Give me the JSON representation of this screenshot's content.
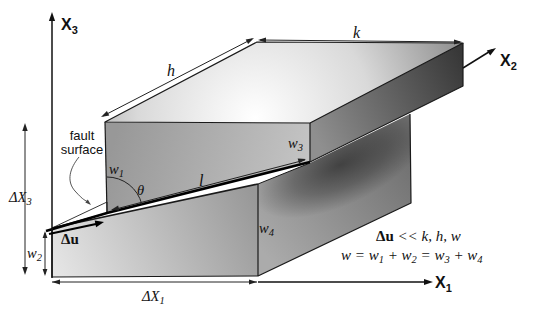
{
  "figure": {
    "axes": {
      "x1": {
        "base": "X",
        "sub": "1"
      },
      "x2": {
        "base": "X",
        "sub": "2"
      },
      "x3": {
        "base": "X",
        "sub": "3"
      }
    },
    "dims": {
      "dx1": {
        "base": "ΔX",
        "sub": "1"
      },
      "dx3": {
        "base": "ΔX",
        "sub": "3"
      },
      "w1": {
        "base": "w",
        "sub": "1"
      },
      "w2": {
        "base": "w",
        "sub": "2"
      },
      "w3": {
        "base": "w",
        "sub": "3"
      },
      "w4": {
        "base": "w",
        "sub": "4"
      },
      "h": "h",
      "k": "k",
      "l": "l",
      "theta": "θ"
    },
    "annotations": {
      "fault_line1": "fault",
      "fault_line2": "surface",
      "slip": "Δu"
    },
    "equations": {
      "magnitude": {
        "lead": "Δu",
        "rest": " << k, h, w"
      },
      "width_sum": {
        "parts": [
          "w = w",
          "1",
          " + w",
          "2",
          " = w",
          "3",
          " + w",
          "4"
        ]
      }
    },
    "colors": {
      "background": "#ffffff",
      "edge": "#1a1a1a",
      "fault_bold": "#000000",
      "top_face_light": "#ffffff",
      "top_face_dark": "#828282",
      "upper_front_face": "#aeaeae",
      "upper_end_face_dark": "#383838",
      "footwall_front_light": "#e6e6e6",
      "footwall_right_face": "#8f8f8f",
      "cast_shadow": "#2b2b2b",
      "fault_sliver": "#ffffff"
    }
  }
}
